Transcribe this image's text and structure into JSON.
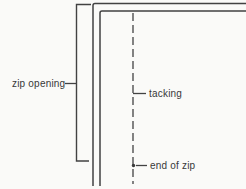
{
  "diagram": {
    "type": "sewing-zip-insertion-diagram",
    "labels": {
      "zip_opening": "zip opening",
      "tacking": "tacking",
      "end_of_zip": "end of zip"
    },
    "colors": {
      "background": "#fafaf8",
      "line": "#424242",
      "text": "#383838"
    }
  }
}
